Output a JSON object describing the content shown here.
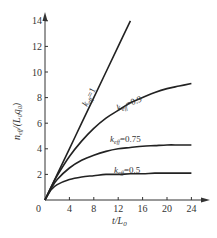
{
  "chart_data": {
    "type": "line",
    "title": "",
    "xlabel": "t/L₀",
    "ylabel": "n_eff/(L₀q₀)",
    "xlim": [
      0,
      26
    ],
    "ylim": [
      0,
      14.5
    ],
    "x_ticks": [
      0,
      4,
      8,
      12,
      16,
      20,
      24
    ],
    "y_ticks": [
      0,
      2,
      4,
      6,
      8,
      10,
      12,
      14
    ],
    "grid": false,
    "legend": "inline labels",
    "series": [
      {
        "name": "k_eff=1",
        "x": [
          0,
          2,
          4,
          6,
          8,
          10,
          12,
          14
        ],
        "values": [
          0,
          2,
          4,
          6,
          8,
          10,
          12,
          14
        ]
      },
      {
        "name": "k_eff=0.9",
        "x": [
          0,
          1,
          2,
          4,
          6,
          8,
          10,
          12,
          14,
          16,
          18,
          20,
          22,
          24
        ],
        "values": [
          0,
          1.0,
          1.9,
          3.4,
          4.6,
          5.6,
          6.4,
          7.0,
          7.6,
          8.0,
          8.4,
          8.7,
          8.9,
          9.1
        ]
      },
      {
        "name": "k_eff=0.75",
        "x": [
          0,
          1,
          2,
          4,
          6,
          8,
          10,
          12,
          14,
          16,
          18,
          20,
          22,
          24
        ],
        "values": [
          0,
          0.9,
          1.6,
          2.5,
          3.1,
          3.5,
          3.8,
          4.0,
          4.1,
          4.2,
          4.25,
          4.3,
          4.3,
          4.3
        ]
      },
      {
        "name": "k_eff=0.5",
        "x": [
          0,
          1,
          2,
          4,
          6,
          8,
          10,
          12,
          14,
          16,
          18,
          20,
          22,
          24
        ],
        "values": [
          0,
          0.8,
          1.2,
          1.6,
          1.8,
          1.9,
          2.0,
          2.0,
          2.05,
          2.05,
          2.1,
          2.1,
          2.1,
          2.1
        ]
      }
    ]
  },
  "labels": {
    "k1": "k",
    "k1_sub": "eff",
    "k1_val": "=1",
    "k09": "k",
    "k09_sub": "eff",
    "k09_val": "=0.9",
    "k075": "k",
    "k075_sub": "eff",
    "k075_val": "=0.75",
    "k05": "k",
    "k05_sub": "eff",
    "k05_val": "=0.5",
    "origin": "0",
    "x_axis_label_main": "t/L",
    "x_axis_label_sub": "0",
    "y_axis_label_main": "n",
    "y_axis_label_sub": "eff",
    "y_axis_label_rest": "/(L",
    "y_axis_label_sub2": "0",
    "y_axis_label_q": "q",
    "y_axis_label_sub3": "0",
    "y_axis_label_close": ")"
  }
}
